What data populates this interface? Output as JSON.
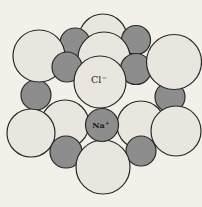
{
  "figure": {
    "labels": {
      "chloride": {
        "base": "Cl",
        "charge": "−"
      },
      "sodium": {
        "base": "Na",
        "charge": "+"
      }
    },
    "colors": {
      "background": "#f3f0e9",
      "chloride_fill": "#e9e6df",
      "sodium_fill": "#8d8d8d",
      "outline": "#2b2a28",
      "label_text": "#1a1a18"
    },
    "ions": [
      {
        "type": "Cl",
        "cx": 103,
        "cy": 38,
        "r": 24
      },
      {
        "type": "Na",
        "cx": 75,
        "cy": 43,
        "r": 15
      },
      {
        "type": "Na",
        "cx": 136,
        "cy": 40,
        "r": 14.5
      },
      {
        "type": "Cl",
        "cx": 104,
        "cy": 58,
        "r": 26
      },
      {
        "type": "Na",
        "cx": 36,
        "cy": 95,
        "r": 15
      },
      {
        "type": "Na",
        "cx": 170,
        "cy": 97,
        "r": 15
      },
      {
        "type": "Na",
        "cx": 136,
        "cy": 69,
        "r": 15.5
      },
      {
        "type": "Cl",
        "cx": 39,
        "cy": 56,
        "r": 26
      },
      {
        "type": "Cl",
        "cx": 174,
        "cy": 62,
        "r": 27.5
      },
      {
        "type": "Na",
        "cx": 67,
        "cy": 67,
        "r": 15
      },
      {
        "type": "Cl",
        "cx": 100,
        "cy": 82,
        "r": 26,
        "label": "chloride"
      },
      {
        "type": "Cl",
        "cx": 65,
        "cy": 124,
        "r": 24
      },
      {
        "type": "Cl",
        "cx": 141,
        "cy": 125,
        "r": 24
      },
      {
        "type": "Cl",
        "cx": 31,
        "cy": 133,
        "r": 24
      },
      {
        "type": "Cl",
        "cx": 176,
        "cy": 131,
        "r": 25
      },
      {
        "type": "Na",
        "cx": 66,
        "cy": 152,
        "r": 16
      },
      {
        "type": "Na",
        "cx": 141,
        "cy": 151,
        "r": 15
      },
      {
        "type": "Cl",
        "cx": 103,
        "cy": 167,
        "r": 27
      },
      {
        "type": "Na",
        "cx": 102,
        "cy": 125,
        "r": 16.5,
        "label": "sodium"
      }
    ]
  }
}
